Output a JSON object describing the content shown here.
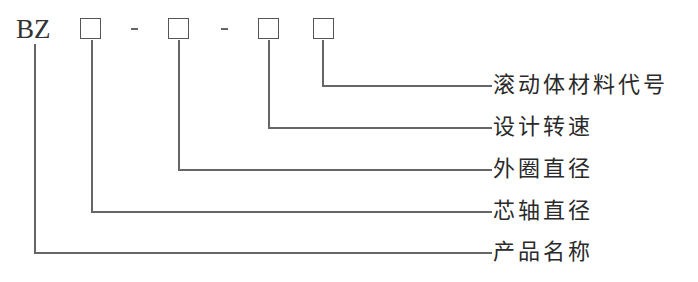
{
  "code": {
    "prefix": "BZ",
    "separator_1": "-",
    "separator_2": "-"
  },
  "labels": [
    {
      "id": "rolling-element-material-code",
      "text": "滚动体材料代号"
    },
    {
      "id": "design-speed",
      "text": "设计转速"
    },
    {
      "id": "outer-ring-diameter",
      "text": "外圈直径"
    },
    {
      "id": "mandrel-diameter",
      "text": "芯轴直径"
    },
    {
      "id": "product-name",
      "text": "产品名称"
    }
  ],
  "colors": {
    "line": "#666666",
    "text": "#2a2a2a",
    "background": "#ffffff"
  }
}
